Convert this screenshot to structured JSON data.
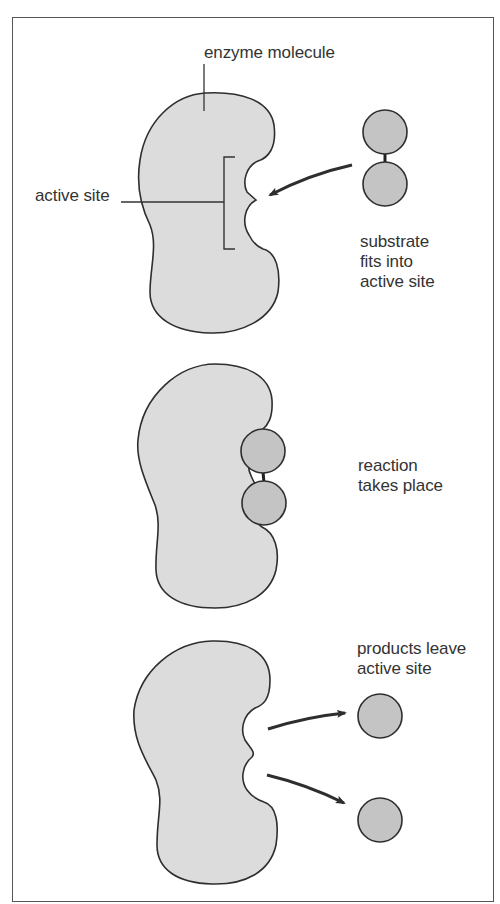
{
  "colors": {
    "enzyme_fill": "#dcdcdc",
    "substrate_fill": "#c4c4c4",
    "outline": "#2e2e2e",
    "text": "#333333",
    "frame": "#555555"
  },
  "panels": [
    {
      "id": "step-1",
      "labels": {
        "enzyme": "enzyme molecule",
        "active_site": "active site",
        "caption_lines": [
          "substrate",
          "fits into",
          "active site"
        ]
      }
    },
    {
      "id": "step-2",
      "labels": {
        "caption_lines": [
          "reaction",
          "takes place"
        ]
      }
    },
    {
      "id": "step-3",
      "labels": {
        "caption_lines": [
          "products leave",
          "active site"
        ]
      }
    }
  ]
}
